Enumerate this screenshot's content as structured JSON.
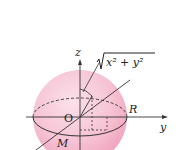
{
  "diagram": {
    "type": "sphere-coordinate-figure",
    "colors": {
      "sphere_fill": "#f4b8cc",
      "sphere_highlight": "#fbe1ea",
      "line": "#333333",
      "background": "#ffffff"
    },
    "labels": {
      "z_axis": "z",
      "y_axis": "y",
      "origin": "O",
      "radius": "R",
      "point": "M",
      "sqrt_expression": "x² + y²"
    }
  }
}
